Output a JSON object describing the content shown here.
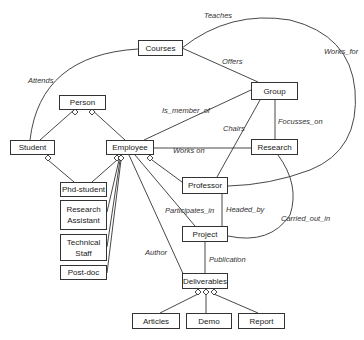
{
  "diagram": {
    "type": "entity-relationship",
    "entities": [
      {
        "id": "courses",
        "label": "Courses"
      },
      {
        "id": "group",
        "label": "Group"
      },
      {
        "id": "person",
        "label": "Person"
      },
      {
        "id": "student",
        "label": "Student"
      },
      {
        "id": "employee",
        "label": "Employee"
      },
      {
        "id": "research",
        "label": "Research"
      },
      {
        "id": "phd_student",
        "label": "Phd-student"
      },
      {
        "id": "research_assistant",
        "label": "Research Assistant"
      },
      {
        "id": "technical_staff",
        "label": "Technical Staff"
      },
      {
        "id": "post_doc",
        "label": "Post-doc"
      },
      {
        "id": "professor",
        "label": "Professor"
      },
      {
        "id": "project",
        "label": "Project"
      },
      {
        "id": "deliverables",
        "label": "Deliverables"
      },
      {
        "id": "articles",
        "label": "Articles"
      },
      {
        "id": "demo",
        "label": "Demo"
      },
      {
        "id": "report",
        "label": "Report"
      }
    ],
    "relationships": [
      {
        "label": "Teaches",
        "from": "professor",
        "to": "courses"
      },
      {
        "label": "Works_for",
        "from": "professor",
        "to": "group"
      },
      {
        "label": "Attends",
        "from": "student",
        "to": "courses"
      },
      {
        "label": "Offers",
        "from": "group",
        "to": "courses"
      },
      {
        "label": "Is_member_of",
        "from": "employee",
        "to": "group"
      },
      {
        "label": "Chairs",
        "from": "professor",
        "to": "group"
      },
      {
        "label": "Focusses_on",
        "from": "group",
        "to": "research"
      },
      {
        "label": "Works on",
        "from": "employee",
        "to": "research"
      },
      {
        "label": "Participates_in",
        "from": "employee",
        "to": "project"
      },
      {
        "label": "Headed_by",
        "from": "project",
        "to": "professor"
      },
      {
        "label": "Carried_out_in",
        "from": "research",
        "to": "project"
      },
      {
        "label": "Author",
        "from": "employee",
        "to": "deliverables"
      },
      {
        "label": "Publication",
        "from": "project",
        "to": "deliverables"
      }
    ],
    "generalizations": [
      {
        "parent": "person",
        "children": [
          "student",
          "employee"
        ]
      },
      {
        "parent": "student",
        "children": [
          "phd_student"
        ]
      },
      {
        "parent": "employee",
        "children": [
          "phd_student",
          "research_assistant",
          "technical_staff",
          "post_doc",
          "professor"
        ]
      },
      {
        "parent": "deliverables",
        "children": [
          "articles",
          "demo",
          "report"
        ]
      }
    ]
  },
  "labels": {
    "courses": "Courses",
    "group": "Group",
    "person": "Person",
    "student": "Student",
    "employee": "Employee",
    "research": "Research",
    "phd_student": "Phd-student",
    "research_assistant_1": "Research",
    "research_assistant_2": "Assistant",
    "technical_staff_1": "Technical",
    "technical_staff_2": "Staff",
    "post_doc": "Post-doc",
    "professor": "Professor",
    "project": "Project",
    "deliverables": "Deliverables",
    "articles": "Articles",
    "demo": "Demo",
    "report": "Report",
    "rel_teaches": "Teaches",
    "rel_works_for": "Works_for",
    "rel_attends": "Attends",
    "rel_offers": "Offers",
    "rel_is_member_of": "Is_member_of",
    "rel_chairs": "Chairs",
    "rel_focusses_on": "Focusses_on",
    "rel_works_on": "Works on",
    "rel_participates_in": "Participates_in",
    "rel_headed_by": "Headed_by",
    "rel_carried_out_in": "Carried_out_in",
    "rel_author": "Author",
    "rel_publication": "Publication"
  }
}
